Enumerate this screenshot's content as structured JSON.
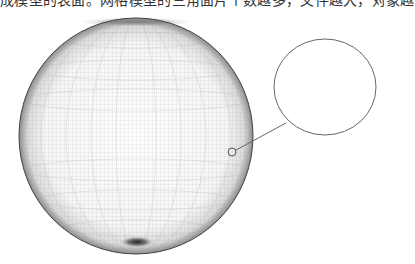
{
  "caption": {
    "text": "成模型的表面。网格模型的三角面片个数越多，文件越大，对象越"
  },
  "figure": {
    "type": "mesh-sphere-illustration",
    "sphere": {
      "cx": 136,
      "cy": 136,
      "rx": 117,
      "ry": 118
    },
    "callout_point": {
      "cx": 232,
      "cy": 152,
      "r": 4
    },
    "magnifier": {
      "cx": 325,
      "cy": 87,
      "rx": 51,
      "ry": 48
    },
    "colors": {
      "stroke": "#666666",
      "mesh": "#9a9a9a",
      "edge": "#444444"
    }
  }
}
